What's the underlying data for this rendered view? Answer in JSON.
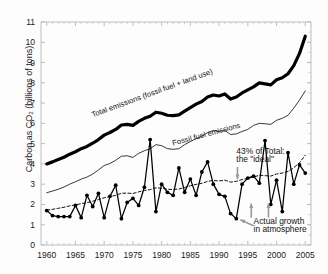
{
  "chart_data": {
    "type": "line",
    "title": "",
    "xlabel": "",
    "ylabel": "Carbon as CO2 (billions of tons)",
    "ylabel_display": "Carbon as CO₂ (billions of tons)",
    "xlim": [
      1959,
      2006
    ],
    "ylim": [
      0,
      11
    ],
    "xticks": [
      1960,
      1965,
      1970,
      1975,
      1980,
      1985,
      1990,
      1995,
      2000,
      2005
    ],
    "xtick_labels": [
      "1960",
      "1965",
      "1970",
      "1975",
      "1980",
      "1985",
      "1990",
      "1995",
      "2000",
      "2005"
    ],
    "yticks": [
      0,
      1,
      2,
      3,
      4,
      5,
      6,
      7,
      8,
      9,
      10,
      11
    ],
    "ytick_labels": [
      "0",
      "1",
      "2",
      "3",
      "4",
      "5",
      "6",
      "7",
      "8",
      "9",
      "10",
      "11"
    ],
    "grid": false,
    "legend_position": "inline-labels",
    "x": [
      1960,
      1961,
      1962,
      1963,
      1964,
      1965,
      1966,
      1967,
      1968,
      1969,
      1970,
      1971,
      1972,
      1973,
      1974,
      1975,
      1976,
      1977,
      1978,
      1979,
      1980,
      1981,
      1982,
      1983,
      1984,
      1985,
      1986,
      1987,
      1988,
      1989,
      1990,
      1991,
      1992,
      1993,
      1994,
      1995,
      1996,
      1997,
      1998,
      1999,
      2000,
      2001,
      2002,
      2003,
      2004,
      2005
    ],
    "series": [
      {
        "name": "Total emissions (fossil fuel + land use)",
        "style": "thick-solid-black",
        "color": "#000000",
        "markers": false,
        "values": [
          4.0,
          4.1,
          4.22,
          4.33,
          4.48,
          4.6,
          4.75,
          4.86,
          5.02,
          5.2,
          5.42,
          5.55,
          5.7,
          5.92,
          5.95,
          5.9,
          6.1,
          6.25,
          6.35,
          6.55,
          6.5,
          6.4,
          6.38,
          6.42,
          6.6,
          6.78,
          6.95,
          7.08,
          7.3,
          7.4,
          7.35,
          7.45,
          7.2,
          7.3,
          7.5,
          7.65,
          7.8,
          8.0,
          7.95,
          7.9,
          8.15,
          8.25,
          8.45,
          8.85,
          9.45,
          10.3
        ]
      },
      {
        "name": "Fossil fuel emissions",
        "style": "thin-solid-black",
        "color": "#222222",
        "markers": false,
        "values": [
          2.58,
          2.66,
          2.75,
          2.86,
          3.0,
          3.12,
          3.25,
          3.35,
          3.5,
          3.7,
          3.92,
          4.02,
          4.18,
          4.38,
          4.4,
          4.32,
          4.52,
          4.65,
          4.75,
          4.95,
          4.9,
          4.75,
          4.72,
          4.75,
          4.95,
          5.1,
          5.25,
          5.35,
          5.55,
          5.65,
          5.6,
          5.65,
          5.45,
          5.48,
          5.6,
          5.7,
          5.9,
          6.0,
          5.98,
          5.95,
          6.15,
          6.25,
          6.4,
          6.75,
          7.15,
          7.6
        ]
      },
      {
        "name": "43% of Total: the \"ideal\"",
        "style": "dashed-black",
        "color": "#111111",
        "markers": false,
        "values": [
          1.72,
          1.76,
          1.81,
          1.86,
          1.93,
          1.98,
          2.04,
          2.09,
          2.16,
          2.24,
          2.33,
          2.39,
          2.45,
          2.55,
          2.56,
          2.54,
          2.62,
          2.69,
          2.73,
          2.82,
          2.8,
          2.75,
          2.74,
          2.76,
          2.84,
          2.92,
          2.99,
          3.04,
          3.14,
          3.18,
          3.16,
          3.2,
          3.1,
          3.14,
          3.23,
          3.29,
          3.35,
          3.44,
          3.42,
          3.4,
          3.5,
          3.55,
          3.63,
          3.81,
          4.06,
          4.43
        ]
      },
      {
        "name": "Actual growth in atmosphere",
        "style": "solid-black-markers",
        "color": "#000000",
        "markers": true,
        "values": [
          1.7,
          1.45,
          1.4,
          1.4,
          1.4,
          1.95,
          1.35,
          2.45,
          1.9,
          2.55,
          1.35,
          2.4,
          2.95,
          1.3,
          2.1,
          2.3,
          1.95,
          2.85,
          5.2,
          1.65,
          3.0,
          2.6,
          2.45,
          3.8,
          2.6,
          3.25,
          2.45,
          3.6,
          4.1,
          3.0,
          2.5,
          2.4,
          1.55,
          1.3,
          3.0,
          3.3,
          3.4,
          3.05,
          5.15,
          2.0,
          3.2,
          1.65,
          4.55,
          3.0,
          3.95,
          3.55
        ]
      }
    ],
    "annotations": [
      {
        "id": "total-label",
        "text": "Total emissions (fossil fuel + land use)",
        "x": 1968,
        "y": 6.3,
        "rotation": -20
      },
      {
        "id": "fossil-label",
        "text": "Fossil fuel emissions",
        "x": 1982,
        "y": 4.9,
        "rotation": -15
      },
      {
        "id": "ideal-label-line1",
        "text": "43% of Total:",
        "x": 1993,
        "y": 4.5
      },
      {
        "id": "ideal-label-line2",
        "text": "the \"ideal\"",
        "x": 1993,
        "y": 4.1
      },
      {
        "id": "actual-label-line1",
        "text": "Actual growth",
        "x": 1996,
        "y": 1.05
      },
      {
        "id": "actual-label-line2",
        "text": "in atmosphere",
        "x": 1996,
        "y": 0.65
      }
    ],
    "arrows": [
      {
        "id": "ideal-arrow",
        "direction": "down",
        "color": "#9a9a9a"
      },
      {
        "id": "actual-arrow-left",
        "direction": "up",
        "color": "#9a9a9a"
      },
      {
        "id": "actual-arrow-right",
        "direction": "up",
        "color": "#9a9a9a"
      },
      {
        "id": "actual-pointer",
        "direction": "up-left",
        "color": "#9a9a9a"
      }
    ],
    "colors": {
      "axis": "#bdbdbd",
      "text": "#1a1a1a",
      "total_line": "#000000",
      "fossil_line": "#222222",
      "ideal_line": "#111111",
      "actual_line": "#000000",
      "arrow": "#9a9a9a",
      "background": "#fdfdfd"
    }
  }
}
